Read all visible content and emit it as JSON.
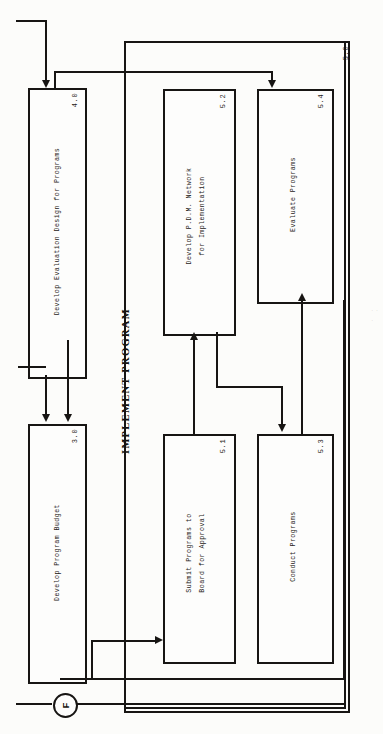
{
  "diagram": {
    "group": {
      "title": "IMPLEMENT PROGRAM",
      "number": "5.0"
    },
    "boxes": [
      {
        "id": "b40",
        "number": "4.0",
        "lines": [
          "Develop Evaluation Design for Programs"
        ]
      },
      {
        "id": "b30",
        "number": "3.0",
        "lines": [
          "Develop Program Budget"
        ]
      },
      {
        "id": "b52",
        "number": "5.2",
        "lines": [
          "Develop P.D.M. Network",
          "for Implementation"
        ]
      },
      {
        "id": "b54",
        "number": "5.4",
        "lines": [
          "Evaluate Programs"
        ]
      },
      {
        "id": "b51",
        "number": "5.1",
        "lines": [
          "Submit Programs to",
          "Board for Approval"
        ]
      },
      {
        "id": "b53",
        "number": "5.3",
        "lines": [
          "Conduct Programs"
        ]
      }
    ],
    "connector_node": {
      "label": "F"
    },
    "colors": {
      "ink": "#171513",
      "paper": "#fcfcfa"
    }
  }
}
